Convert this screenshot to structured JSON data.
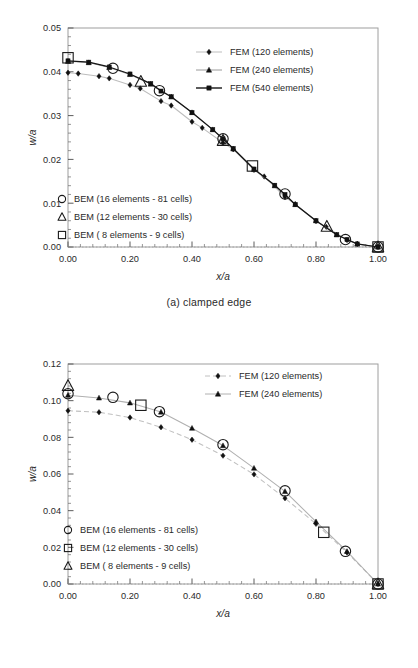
{
  "figure": {
    "panels": [
      {
        "id": "panel-a",
        "caption": "(a) clamped edge",
        "chart_data": {
          "type": "line",
          "title": "",
          "xlabel": "x/a",
          "ylabel": "w/a",
          "xlim": [
            0.0,
            1.0
          ],
          "ylim": [
            0.0,
            0.05
          ],
          "xticks": [
            "0.00",
            "0.20",
            "0.40",
            "0.60",
            "0.80",
            "1.00"
          ],
          "xtick_values": [
            0.0,
            0.2,
            0.4,
            0.6,
            0.8,
            1.0
          ],
          "yticks": [
            "0.00",
            "0.01",
            "0.02",
            "0.03",
            "0.04",
            "0.05"
          ],
          "ytick_values": [
            0.0,
            0.01,
            0.02,
            0.03,
            0.04,
            0.05
          ],
          "grid": false,
          "legend_position": "top-right and lower-left",
          "series": [
            {
              "name": "FEM (120 elements)",
              "marker": "diamond",
              "line": "solid-light",
              "color": "#bdbdbd",
              "marker_color": "#111111",
              "x": [
                0.0,
                0.033,
                0.1,
                0.133,
                0.2,
                0.233,
                0.3,
                0.333,
                0.4,
                0.433,
                0.5,
                0.533,
                0.6,
                0.633,
                0.7,
                0.733,
                0.8,
                0.833,
                0.9,
                0.933,
                1.0
              ],
              "y": [
                0.0398,
                0.0396,
                0.039,
                0.0385,
                0.037,
                0.0362,
                0.0333,
                0.0323,
                0.0286,
                0.0272,
                0.0238,
                0.0223,
                0.0176,
                0.0161,
                0.0114,
                0.0098,
                0.0059,
                0.0046,
                0.0016,
                0.0007,
                0.0
              ]
            },
            {
              "name": "FEM (240 elements)",
              "marker": "triangle",
              "line": "solid-light",
              "color": "#9a9a9a",
              "marker_color": "#111111",
              "x": [
                0.0,
                0.067,
                0.133,
                0.2,
                0.267,
                0.333,
                0.4,
                0.467,
                0.533,
                0.6,
                0.667,
                0.733,
                0.8,
                0.867,
                0.933,
                1.0
              ],
              "y": [
                0.0424,
                0.0421,
                0.041,
                0.0394,
                0.0372,
                0.0343,
                0.0307,
                0.0268,
                0.0224,
                0.0177,
                0.014,
                0.0097,
                0.006,
                0.0028,
                0.0007,
                0.0
              ]
            },
            {
              "name": "FEM (540 elements)",
              "marker": "square",
              "line": "solid-dark",
              "color": "#151515",
              "marker_color": "#111111",
              "x": [
                0.0,
                0.067,
                0.133,
                0.2,
                0.267,
                0.3,
                0.333,
                0.4,
                0.467,
                0.5,
                0.533,
                0.6,
                0.667,
                0.7,
                0.733,
                0.8,
                0.867,
                0.9,
                0.933,
                1.0
              ],
              "y": [
                0.0425,
                0.0422,
                0.0411,
                0.0395,
                0.0373,
                0.0356,
                0.0343,
                0.0307,
                0.0268,
                0.0247,
                0.0225,
                0.0178,
                0.0141,
                0.012,
                0.0097,
                0.006,
                0.0028,
                0.0017,
                0.0007,
                0.0
              ]
            }
          ],
          "marker_series": [
            {
              "name": "BEM (16 elements - 81 cells)",
              "marker": "circle",
              "x": [
                0.145,
                0.295,
                0.5,
                0.7,
                0.895,
                1.0
              ],
              "y": [
                0.0408,
                0.0357,
                0.0247,
                0.0121,
                0.0017,
                0.0
              ]
            },
            {
              "name": "BEM (12 elements - 30 cells)",
              "marker": "triangle-open",
              "x": [
                0.235,
                0.5,
                0.835,
                1.0
              ],
              "y": [
                0.0378,
                0.0243,
                0.0047,
                0.0
              ]
            },
            {
              "name": "BEM ( 8 elements - 9 cells)",
              "marker": "square-open",
              "x": [
                0.0,
                0.595,
                1.0
              ],
              "y": [
                0.0432,
                0.0185,
                0.0
              ]
            }
          ],
          "legend_fem": [
            "FEM (120 elements)",
            "FEM (240 elements)",
            "FEM (540 elements)"
          ],
          "legend_bem": [
            "BEM (16 elements - 81 cells)",
            "BEM (12 elements - 30 cells)",
            "BEM ( 8 elements - 9 cells)"
          ]
        }
      },
      {
        "id": "panel-b",
        "caption": "(b) simply supported edge",
        "chart_data": {
          "type": "line",
          "title": "",
          "xlabel": "x/a",
          "ylabel": "w/a",
          "xlim": [
            0.0,
            1.0
          ],
          "ylim": [
            0.0,
            0.12
          ],
          "xticks": [
            "0.00",
            "0.20",
            "0.40",
            "0.60",
            "0.80",
            "1.00"
          ],
          "xtick_values": [
            0.0,
            0.2,
            0.4,
            0.6,
            0.8,
            1.0
          ],
          "yticks": [
            "0.00",
            "0.02",
            "0.04",
            "0.06",
            "0.08",
            "0.10",
            "0.12"
          ],
          "ytick_values": [
            0.0,
            0.02,
            0.04,
            0.06,
            0.08,
            0.1,
            0.12
          ],
          "grid": false,
          "legend_position": "top-right and lower-left",
          "series": [
            {
              "name": "FEM (120 elements)",
              "marker": "diamond",
              "line": "dashed-light",
              "color": "#c0c0c0",
              "marker_color": "#111111",
              "x": [
                0.0,
                0.1,
                0.2,
                0.3,
                0.4,
                0.5,
                0.6,
                0.7,
                0.8,
                0.9,
                1.0
              ],
              "y": [
                0.0945,
                0.0937,
                0.0908,
                0.0855,
                0.0787,
                0.07,
                0.0598,
                0.0468,
                0.0328,
                0.0172,
                0.0
              ]
            },
            {
              "name": "FEM (240 elements)",
              "marker": "triangle",
              "line": "solid-light",
              "color": "#b0b0b0",
              "marker_color": "#111111",
              "x": [
                0.0,
                0.1,
                0.2,
                0.3,
                0.4,
                0.5,
                0.6,
                0.7,
                0.8,
                0.9,
                1.0
              ],
              "y": [
                0.103,
                0.1015,
                0.0988,
                0.0938,
                0.085,
                0.0755,
                0.0632,
                0.0505,
                0.034,
                0.0178,
                0.0
              ]
            }
          ],
          "marker_series": [
            {
              "name": "BEM (16 elements - 81 cells)",
              "marker": "circle",
              "x": [
                0.0,
                0.145,
                0.295,
                0.5,
                0.7,
                0.895,
                1.0
              ],
              "y": [
                0.1038,
                0.1018,
                0.094,
                0.076,
                0.0508,
                0.0178,
                0.0
              ]
            },
            {
              "name": "BEM (12 elements - 30 cells)",
              "marker": "square-open",
              "x": [
                0.235,
                0.825,
                1.0
              ],
              "y": [
                0.0975,
                0.0282,
                0.0
              ]
            },
            {
              "name": "BEM ( 8 elements - 9 cells)",
              "marker": "triangle-open",
              "x": [
                0.0,
                1.0
              ],
              "y": [
                0.1082,
                0.0
              ]
            }
          ],
          "legend_fem": [
            "FEM (120 elements)",
            "FEM (240 elements)"
          ],
          "legend_bem": [
            "BEM (16 elements - 81 cells)",
            "BEM (12 elements - 30 cells)",
            "BEM ( 8 elements - 9 cells)"
          ]
        }
      }
    ]
  }
}
